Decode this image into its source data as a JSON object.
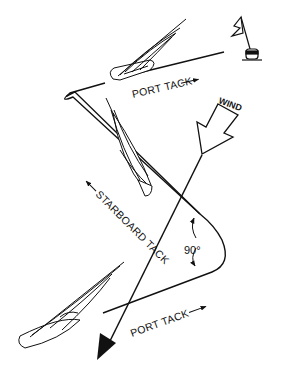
{
  "diagram": {
    "labels": {
      "port_tack_top": "PORT TACK",
      "starboard_tack": "STARBOARD TACK",
      "port_tack_bottom": "PORT TACK",
      "wind": "WIND",
      "angle": "90°"
    },
    "elements": {
      "mark": "flag-buoy-icon",
      "boats": [
        "sailboat-top",
        "sailboat-middle",
        "sailboat-bottom"
      ],
      "wind_arrow": "wind-arrow-icon",
      "wind_line": "wind-direction-line"
    },
    "colors": {
      "ink": "#111111",
      "background": "#ffffff"
    }
  }
}
